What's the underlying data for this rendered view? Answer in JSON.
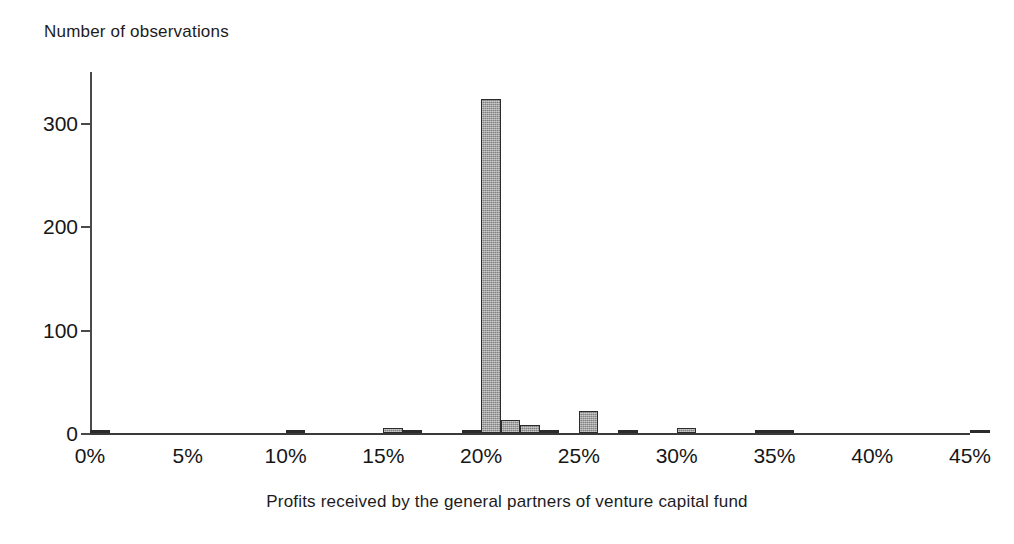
{
  "chart_data": {
    "type": "bar",
    "title": "",
    "ylabel": "Number of observations",
    "xlabel": "Profits received by the general partners of venture capital fund",
    "xlim": [
      0,
      45
    ],
    "ylim": [
      0,
      350
    ],
    "grid": false,
    "legend": null,
    "bar_width_percent": 1,
    "y_ticks": [
      0,
      100,
      200,
      300
    ],
    "y_tick_labels": [
      "0",
      "100",
      "200",
      "300"
    ],
    "x_ticks": [
      0,
      5,
      10,
      15,
      20,
      25,
      30,
      35,
      40,
      45
    ],
    "x_tick_labels": [
      "0%",
      "5%",
      "10%",
      "15%",
      "20%",
      "25%",
      "30%",
      "35%",
      "40%",
      "45%"
    ],
    "x": [
      0,
      10,
      15,
      16,
      19,
      20,
      21,
      22,
      23,
      25,
      27,
      30,
      34,
      35,
      45
    ],
    "values": [
      2,
      3,
      5,
      1,
      1,
      323,
      13,
      8,
      3,
      21,
      1,
      5,
      1,
      1,
      1
    ],
    "points": [
      {
        "x": 0,
        "label": "0%",
        "value": 2
      },
      {
        "x": 10,
        "label": "10%",
        "value": 3
      },
      {
        "x": 15,
        "label": "15%",
        "value": 5
      },
      {
        "x": 16,
        "label": "16%",
        "value": 1
      },
      {
        "x": 19,
        "label": "19%",
        "value": 1
      },
      {
        "x": 20,
        "label": "20%",
        "value": 323
      },
      {
        "x": 21,
        "label": "21%",
        "value": 13
      },
      {
        "x": 22,
        "label": "22%",
        "value": 8
      },
      {
        "x": 23,
        "label": "23%",
        "value": 3
      },
      {
        "x": 25,
        "label": "25%",
        "value": 21
      },
      {
        "x": 27,
        "label": "27%",
        "value": 1
      },
      {
        "x": 30,
        "label": "30%",
        "value": 5
      },
      {
        "x": 34,
        "label": "34%",
        "value": 1
      },
      {
        "x": 35,
        "label": "35%",
        "value": 1
      },
      {
        "x": 45,
        "label": "45%",
        "value": 1
      }
    ],
    "colors": {
      "bar_fill": "#9d9d9d",
      "bar_border": "#2b2b2b",
      "axis": "#3a3a3a",
      "text": "#161616",
      "background": "#ffffff"
    }
  }
}
